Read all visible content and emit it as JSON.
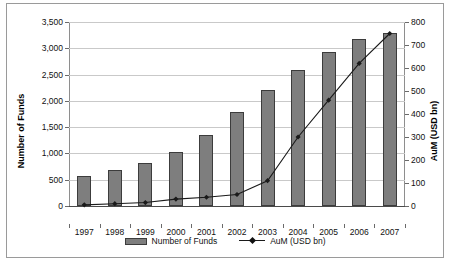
{
  "chart_data": {
    "type": "bar",
    "title": "",
    "subtitle": "",
    "xlabel": "",
    "ylabel": "Number of Funds",
    "y2label": "AuM (USD bn)",
    "categories": [
      "1997",
      "1998",
      "1999",
      "2000",
      "2001",
      "2002",
      "2003",
      "2004",
      "2005",
      "2006",
      "2007"
    ],
    "series": [
      {
        "name": "Number of Funds",
        "type": "bar",
        "axis": "left",
        "color": "#7e7e7e",
        "values": [
          570,
          680,
          820,
          1020,
          1350,
          1790,
          2210,
          2580,
          2930,
          3180,
          3300
        ]
      },
      {
        "name": "AuM (USD bn)",
        "type": "line",
        "axis": "right",
        "color": "#1a1a1a",
        "marker": "diamond",
        "values": [
          5,
          10,
          15,
          30,
          38,
          50,
          110,
          300,
          460,
          620,
          750
        ]
      }
    ],
    "ylim": [
      0,
      3500
    ],
    "y2lim": [
      0,
      800
    ],
    "yticks": [
      "0",
      "500",
      "1,000",
      "1,500",
      "2,000",
      "2,500",
      "3,000",
      "3,500"
    ],
    "ytick_values": [
      0,
      500,
      1000,
      1500,
      2000,
      2500,
      3000,
      3500
    ],
    "y2ticks": [
      "0",
      "100",
      "200",
      "300",
      "400",
      "500",
      "600",
      "700",
      "800"
    ],
    "y2tick_values": [
      0,
      100,
      200,
      300,
      400,
      500,
      600,
      700,
      800
    ],
    "grid": true,
    "legend_position": "bottom",
    "legend": [
      "Number of Funds",
      "AuM (USD bn)"
    ]
  },
  "axes": {
    "left_title": "Number of Funds",
    "right_title": "AuM (USD bn)"
  },
  "legend": {
    "bar_label": "Number of Funds",
    "line_label": "AuM (USD bn)"
  },
  "colors": {
    "bar_fill": "#7e7e7e",
    "bar_stroke": "#3c3c3c",
    "line": "#1a1a1a",
    "grid": "#c9c9c9",
    "frame": "#9a9a9a"
  }
}
